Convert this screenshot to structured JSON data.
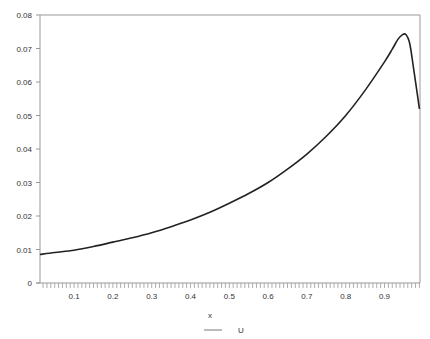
{
  "chart_data": {
    "type": "line",
    "title": "",
    "xlabel": "x",
    "ylabel": "",
    "xlim": [
      0.012,
      0.99
    ],
    "ylim": [
      0,
      0.08
    ],
    "grid": false,
    "legend_position": "bottom",
    "x_ticks": [
      "0.1",
      "0.2",
      "0.3",
      "0.4",
      "0.5",
      "0.6",
      "0.7",
      "0.8",
      "0.9"
    ],
    "y_ticks": [
      "0",
      "0.01",
      "0.02",
      "0.03",
      "0.04",
      "0.05",
      "0.06",
      "0.07",
      "0.08"
    ],
    "series": [
      {
        "name": "U",
        "color": "#222222",
        "x": [
          0.012,
          0.05,
          0.1,
          0.15,
          0.2,
          0.25,
          0.3,
          0.35,
          0.4,
          0.45,
          0.5,
          0.55,
          0.6,
          0.65,
          0.7,
          0.75,
          0.8,
          0.85,
          0.9,
          0.92,
          0.935,
          0.945,
          0.955,
          0.965,
          0.975,
          0.99
        ],
        "values": [
          0.0085,
          0.0091,
          0.0098,
          0.0109,
          0.0122,
          0.0135,
          0.015,
          0.0168,
          0.0188,
          0.0211,
          0.0238,
          0.0267,
          0.03,
          0.034,
          0.0385,
          0.0438,
          0.05,
          0.0575,
          0.066,
          0.0698,
          0.0728,
          0.074,
          0.0742,
          0.0715,
          0.064,
          0.052
        ]
      }
    ]
  },
  "legend": {
    "x_label": "x",
    "series_label": "U"
  }
}
